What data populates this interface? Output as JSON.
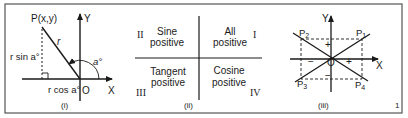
{
  "figure_number": "1",
  "colors": {
    "ink": "#1a1a1a",
    "frame": "#555555",
    "background": "#ffffff"
  },
  "panel1": {
    "caption": "(i)",
    "point_label": "P(x,y)",
    "radius_label": "r",
    "opposite_label": "r sin a°",
    "adjacent_label": "r cos a°",
    "angle_label": "a°",
    "origin_label": "O",
    "x_axis_label": "X",
    "y_axis_label": "Y"
  },
  "panel2": {
    "caption": "(ii)",
    "quadrants": [
      {
        "numeral": "I",
        "line1": "All",
        "line2": "positive"
      },
      {
        "numeral": "II",
        "line1": "Sine",
        "line2": "positive"
      },
      {
        "numeral": "III",
        "line1": "Tangent",
        "line2": "positive"
      },
      {
        "numeral": "IV",
        "line1": "Cosine",
        "line2": "positive"
      }
    ]
  },
  "panel3": {
    "caption": "(iii)",
    "points": [
      "P1",
      "P2",
      "P3",
      "P4"
    ],
    "origin_label": "O",
    "x_axis_label": "X",
    "y_axis_label": "Y",
    "signs": {
      "up": "+",
      "right": "+",
      "left": "−",
      "down": "−"
    }
  }
}
